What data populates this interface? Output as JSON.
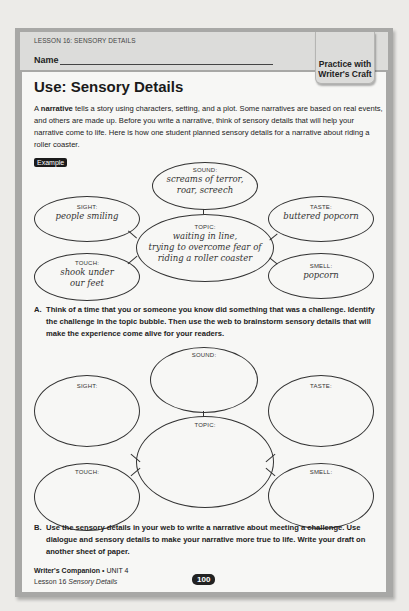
{
  "header": {
    "lesson_label": "LESSON 16: SENSORY DETAILS",
    "name_label": "Name",
    "tab_line1": "Practice with",
    "tab_line2": "Writer's Craft"
  },
  "title": "Use: Sensory Details",
  "intro": {
    "prefix": "A ",
    "bold_term": "narrative",
    "text": " tells a story using characters, setting, and a plot. Some narratives are based on real events, and others are made up. Before you write a narrative, think of sensory details that will help your narrative come to life. Here is how one student planned sensory details for a narrative about riding a roller coaster."
  },
  "example": {
    "badge": "Example",
    "bubbles": {
      "sound": {
        "label": "SOUND:",
        "line1": "screams of terror,",
        "line2": "roar, screech"
      },
      "sight": {
        "label": "SIGHT:",
        "line1": "people smiling",
        "line2": ""
      },
      "taste": {
        "label": "TASTE:",
        "line1": "buttered popcorn",
        "line2": ""
      },
      "topic": {
        "label": "TOPIC:",
        "line1": "waiting in line,",
        "line2": "trying to overcome fear of",
        "line3": "riding a roller coaster"
      },
      "touch": {
        "label": "TOUCH:",
        "line1": "shook under",
        "line2": "our feet"
      },
      "smell": {
        "label": "SMELL:",
        "line1": "popcorn",
        "line2": ""
      }
    }
  },
  "part_a": {
    "letter": "A.",
    "text": "Think of a time that you or someone you know did something that was a challenge. Identify the challenge in the topic bubble. Then use the web to brainstorm sensory details that will make the experience come alive for your readers.",
    "bubbles": {
      "sound": {
        "label": "SOUND:"
      },
      "sight": {
        "label": "SIGHT:"
      },
      "taste": {
        "label": "TASTE:"
      },
      "topic": {
        "label": "TOPIC:"
      },
      "touch": {
        "label": "TOUCH:"
      },
      "smell": {
        "label": "SMELL:"
      }
    }
  },
  "part_b": {
    "letter": "B.",
    "text": "Use the sensory details in your web to write a narrative about meeting a challenge. Use dialogue and sensory details to make your narrative more true to life. Write your draft on another sheet of paper."
  },
  "footer": {
    "book": "Writer's Companion",
    "bullet": " • ",
    "unit": "UNIT 4",
    "lesson_prefix": "Lesson 16 ",
    "lesson_title": "Sensory Details",
    "page_number": "100"
  }
}
